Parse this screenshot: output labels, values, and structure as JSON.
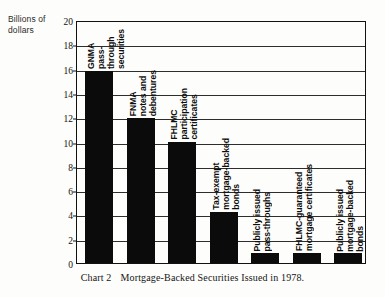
{
  "axis_title": "Billions of\ndollars",
  "axis_title_lines": [
    "Billions of",
    "dollars"
  ],
  "caption": {
    "number": "Chart 2",
    "text": "Mortgage-Backed Securities Issued in 1978."
  },
  "chart_data": {
    "type": "bar",
    "xlabel": "",
    "ylabel": "Billions of dollars",
    "ylim": [
      0,
      20
    ],
    "yticks": [
      0,
      2,
      4,
      6,
      8,
      10,
      12,
      14,
      16,
      18,
      20
    ],
    "grid": true,
    "legend": "none",
    "orientation": "vertical",
    "categories": [
      "GNMA pass-through securities",
      "FNMA notes and debentures",
      "FHLMC participation certificates",
      "Tax-exempt mortgage-backed bonds",
      "Publicly issued pass-throughs",
      "FHLMC-guaranteed mortgage certificates",
      "Publicly issued mortgage-backed bonds"
    ],
    "values": [
      15.8,
      11.9,
      10.0,
      4.2,
      0.8,
      0.8,
      0.8
    ],
    "bars": [
      {
        "label_lines": [
          "GNMA",
          "pass-through",
          "securities"
        ],
        "value": 15.8,
        "bold": true
      },
      {
        "label_lines": [
          "FNMA",
          "notes  and",
          "debentures"
        ],
        "value": 11.9,
        "bold": true
      },
      {
        "label_lines": [
          "FHLMC",
          "participation",
          "certificates"
        ],
        "value": 10.0,
        "bold": true
      },
      {
        "label_lines": [
          "Tax-exempt",
          "mortgage-backed",
          "bonds"
        ],
        "value": 4.2,
        "bold": true
      },
      {
        "label_lines": [
          "Publicly issued",
          "pass-throughs"
        ],
        "value": 0.8,
        "bold": true
      },
      {
        "label_lines": [
          "FHLMC-guaranteed",
          "mortgage  certificates"
        ],
        "value": 0.8,
        "bold": true
      },
      {
        "label_lines": [
          "Publicly issued",
          "mortgage-backed",
          "bonds"
        ],
        "value": 0.8,
        "bold": true
      }
    ]
  },
  "colors": {
    "bar": "#0b0b0b",
    "grid": "#2d2d2d",
    "frame": "#111111",
    "background": "#fdfdfb",
    "text": "#1a1a1a"
  }
}
